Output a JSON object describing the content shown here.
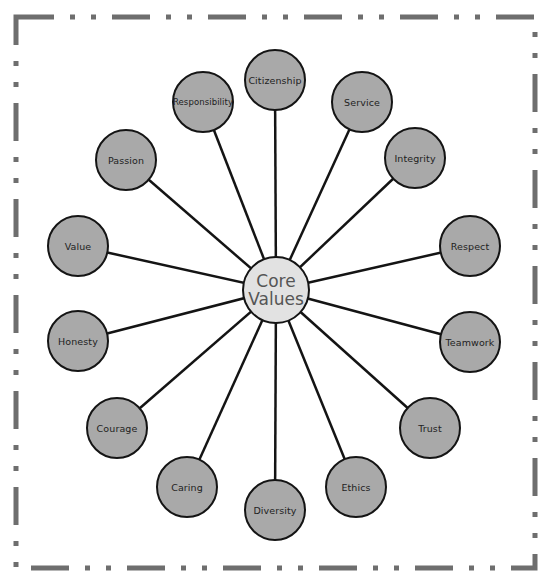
{
  "diagram": {
    "type": "hub-and-spoke",
    "center": {
      "line1": "Core",
      "line2": "Values",
      "x": 276,
      "y": 290
    },
    "nodes": [
      {
        "label": "Citizenship",
        "x": 275,
        "y": 80
      },
      {
        "label": "Service",
        "x": 362,
        "y": 102
      },
      {
        "label": "Integrity",
        "x": 415,
        "y": 158
      },
      {
        "label": "Respect",
        "x": 470,
        "y": 246
      },
      {
        "label": "Teamwork",
        "x": 470,
        "y": 342
      },
      {
        "label": "Trust",
        "x": 430,
        "y": 428
      },
      {
        "label": "Ethics",
        "x": 356,
        "y": 487
      },
      {
        "label": "Diversity",
        "x": 275,
        "y": 510
      },
      {
        "label": "Caring",
        "x": 187,
        "y": 487
      },
      {
        "label": "Courage",
        "x": 117,
        "y": 428
      },
      {
        "label": "Honesty",
        "x": 78,
        "y": 341
      },
      {
        "label": "Value",
        "x": 78,
        "y": 246
      },
      {
        "label": "Passion",
        "x": 126,
        "y": 160
      },
      {
        "label": "Responsibility",
        "x": 203,
        "y": 102
      }
    ],
    "colors": {
      "node_fill": "#a9a9a9",
      "center_fill": "#e2e2e2",
      "stroke": "#141414",
      "border": "#6e6e6e"
    }
  }
}
